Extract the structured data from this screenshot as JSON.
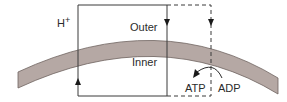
{
  "diagram": {
    "type": "chemiosmotic membrane schematic",
    "labels": {
      "ion": "H",
      "ion_charge": "+",
      "outer": "Outer",
      "inner": "Inner",
      "atp": "ATP",
      "adp": "ADP"
    },
    "colors": {
      "membrane_fill": "#b5a8a4",
      "membrane_edge": "#6e6360",
      "line": "#3a3a3a",
      "text": "#2b2b2b",
      "background": "#ffffff"
    },
    "elements": {
      "solid_loop": "Solid rectangular circuit crossing the membrane; arrow up on left side, arrow down on right side",
      "dashed_loop": "Dashed rectangular circuit extending right; arrow down through membrane",
      "curved_arrow": "Curved arrow from ADP to ATP on inner side"
    }
  }
}
